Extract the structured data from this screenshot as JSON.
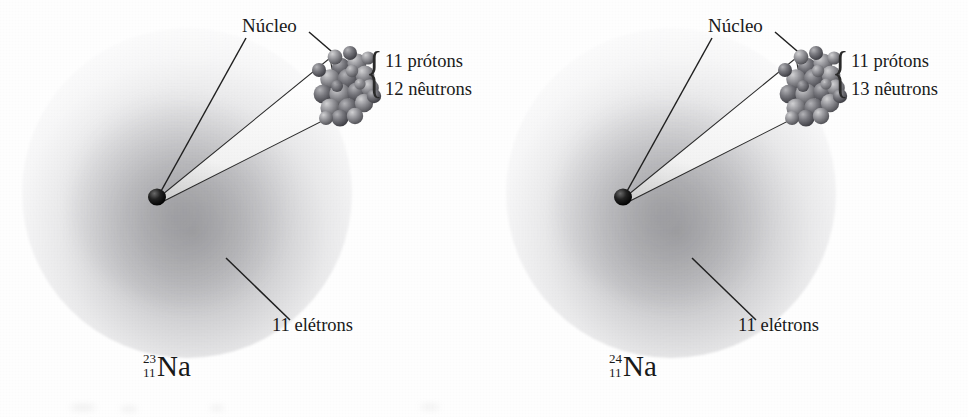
{
  "figure": {
    "type": "diagram",
    "language": "pt-BR",
    "background_color": "#ffffff",
    "ink_color": "#1a1a1a",
    "cloud_color": "#76767a",
    "nucleon_color": "#808085"
  },
  "panels": [
    {
      "id": "na-23",
      "nucleus_label": "Núcleo",
      "protons_label": "11 prótons",
      "neutrons_label": "12 nêutrons",
      "electrons_label": "11 elétrons",
      "isotope": {
        "mass_number": "23",
        "atomic_number": "11",
        "symbol": "Na"
      }
    },
    {
      "id": "na-24",
      "nucleus_label": "Núcleo",
      "protons_label": "11 prótons",
      "neutrons_label": "13 nêutrons",
      "electrons_label": "11 elétrons",
      "isotope": {
        "mass_number": "24",
        "atomic_number": "11",
        "symbol": "Na"
      }
    }
  ]
}
